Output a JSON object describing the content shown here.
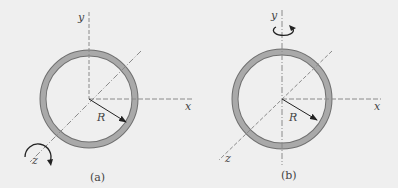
{
  "figure": {
    "background": "#efefef",
    "ring_fill": "#a9a9a9",
    "ring_edge": "#707070",
    "axis_color": "#8a8a8a",
    "panels": [
      {
        "id": "a",
        "caption": "(a)",
        "axis_labels": {
          "x": "x",
          "y": "y",
          "z": "z"
        },
        "radius_label": "R",
        "rotation_axis": "z"
      },
      {
        "id": "b",
        "caption": "(b)",
        "axis_labels": {
          "x": "x",
          "y": "y",
          "z": "z"
        },
        "radius_label": "R",
        "rotation_axis": "y"
      }
    ]
  }
}
